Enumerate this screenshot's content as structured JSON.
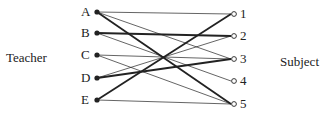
{
  "left_group": {
    "label": "Teacher"
  },
  "right_group": {
    "label": "Subject"
  },
  "left_nodes": [
    {
      "id": "A",
      "label": "A",
      "x": 97,
      "y": 12
    },
    {
      "id": "B",
      "label": "B",
      "x": 97,
      "y": 33
    },
    {
      "id": "C",
      "label": "C",
      "x": 97,
      "y": 55
    },
    {
      "id": "D",
      "label": "D",
      "x": 97,
      "y": 78
    },
    {
      "id": "E",
      "label": "E",
      "x": 97,
      "y": 100
    }
  ],
  "right_nodes": [
    {
      "id": "1",
      "label": "1",
      "x": 234,
      "y": 14
    },
    {
      "id": "2",
      "label": "2",
      "x": 234,
      "y": 36
    },
    {
      "id": "3",
      "label": "3",
      "x": 234,
      "y": 59
    },
    {
      "id": "4",
      "label": "4",
      "x": 234,
      "y": 81
    },
    {
      "id": "5",
      "label": "5",
      "x": 234,
      "y": 104
    }
  ],
  "edges": [
    {
      "from": "A",
      "to": "1",
      "weight": "thin"
    },
    {
      "from": "A",
      "to": "3",
      "weight": "thin"
    },
    {
      "from": "A",
      "to": "5",
      "weight": "thick"
    },
    {
      "from": "B",
      "to": "2",
      "weight": "thick"
    },
    {
      "from": "B",
      "to": "4",
      "weight": "thin"
    },
    {
      "from": "C",
      "to": "3",
      "weight": "thin"
    },
    {
      "from": "C",
      "to": "5",
      "weight": "thin"
    },
    {
      "from": "D",
      "to": "2",
      "weight": "thin"
    },
    {
      "from": "D",
      "to": "3",
      "weight": "thick"
    },
    {
      "from": "E",
      "to": "1",
      "weight": "thick"
    },
    {
      "from": "E",
      "to": "5",
      "weight": "thin"
    }
  ],
  "colors": {
    "line": "#222222",
    "background": "#ffffff"
  }
}
